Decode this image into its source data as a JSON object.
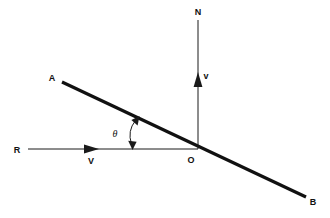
{
  "figure": {
    "background_color": "#ffffff",
    "ink_color": "#111111",
    "width": 330,
    "height": 218,
    "labels": {
      "line_start": "A",
      "line_end": "B",
      "origin": "O",
      "normal_top": "N",
      "reference_left": "R",
      "velocity_horizontal": "V",
      "velocity_vertical": "v",
      "angle": "θ"
    },
    "geometry": {
      "line_ab": {
        "x1": 62,
        "y1": 82,
        "x2": 306,
        "y2": 197
      },
      "line_rn_horizontal": {
        "x1": 28,
        "y1": 149,
        "x2": 198,
        "y2": 149
      },
      "line_normal_vertical": {
        "x1": 198,
        "y1": 20,
        "x2": 198,
        "y2": 149
      },
      "origin_point": {
        "x": 198,
        "y": 149
      },
      "angle_vertex": {
        "x": 198,
        "y": 149
      },
      "angle_arc_from": {
        "x": 132,
        "y": 149
      },
      "angle_arc_to": {
        "x": 138,
        "y": 118
      },
      "arrow_v_horizontal_tip": {
        "x": 98,
        "y": 149
      },
      "arrow_v_vertical_tip": {
        "x": 198,
        "y": 73
      }
    },
    "label_positions": {
      "A": {
        "x": 53,
        "y": 80
      },
      "B": {
        "x": 310,
        "y": 204
      },
      "O": {
        "x": 191,
        "y": 162
      },
      "N": {
        "x": 194,
        "y": 16
      },
      "R": {
        "x": 15,
        "y": 152
      },
      "V": {
        "x": 89,
        "y": 163
      },
      "v": {
        "x": 204,
        "y": 79
      },
      "theta": {
        "x": 113,
        "y": 136
      }
    }
  }
}
